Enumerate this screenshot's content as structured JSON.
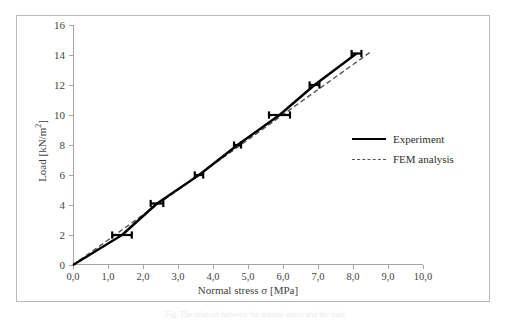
{
  "figure": {
    "background": "#ffffff",
    "border_color": "#b9b9b9",
    "caption_faint": "Fig. The relation between the normal stress and the load"
  },
  "axes": {
    "x_title": "Normal stress σ [MPa]",
    "y_title_prefix": "Load [kN/m",
    "y_title_sup": "2",
    "y_title_suffix": "]",
    "x_ticks": [
      "0,0",
      "1,0",
      "2,0",
      "3,0",
      "4,0",
      "5,0",
      "6,0",
      "7,0",
      "8,0",
      "9,0",
      "10,0"
    ],
    "y_ticks": [
      "0",
      "2",
      "4",
      "6",
      "8",
      "10",
      "12",
      "14",
      "16"
    ],
    "xlim": [
      0,
      10
    ],
    "ylim": [
      0,
      16
    ],
    "axis_color": "#a6a6a6",
    "tick_text_color": "#3f3f3f"
  },
  "legend": {
    "position": "inside-right",
    "items": [
      {
        "label": "Experiment",
        "style": "solid",
        "color": "#000000"
      },
      {
        "label": "FEM analysis",
        "style": "dashed",
        "color": "#555555"
      }
    ]
  },
  "chart_data": {
    "type": "line",
    "title": "",
    "xlabel": "Normal stress σ [MPa]",
    "ylabel": "Load [kN/m2]",
    "xlim": [
      0,
      10
    ],
    "ylim": [
      0,
      16
    ],
    "grid": false,
    "legend_position": "inside-right",
    "series": [
      {
        "name": "Experiment",
        "style": "solid",
        "color": "#000000",
        "x": [
          0.0,
          1.4,
          2.4,
          3.6,
          4.7,
          5.9,
          6.9,
          8.1
        ],
        "y": [
          0.0,
          2.0,
          4.1,
          6.0,
          8.0,
          10.0,
          12.0,
          14.1
        ],
        "x_error": [
          0.0,
          0.28,
          0.18,
          0.12,
          0.1,
          0.3,
          0.14,
          0.14
        ],
        "marker": "horizontal-error-bar"
      },
      {
        "name": "FEM analysis",
        "style": "dashed",
        "color": "#555555",
        "x": [
          0.0,
          8.5
        ],
        "y": [
          0.0,
          14.2
        ]
      }
    ]
  }
}
